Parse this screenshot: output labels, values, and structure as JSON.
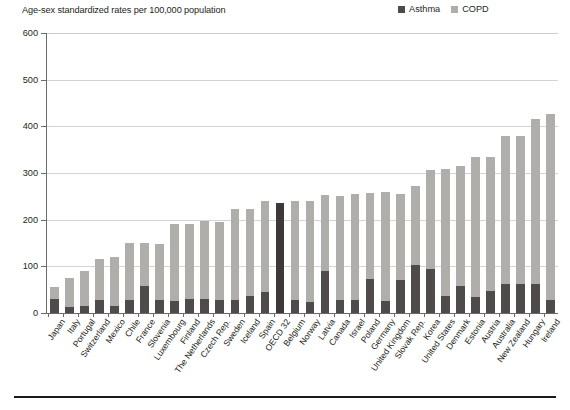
{
  "header": {
    "axis_note": "Age-sex standardized rates per 100,000 population"
  },
  "legend": {
    "position": "top-right",
    "entries": [
      {
        "label": "Asthma",
        "color": "#4f4b4a"
      },
      {
        "label": "COPD",
        "color": "#b0aeab"
      }
    ]
  },
  "colors": {
    "asthma": "#4f4b4a",
    "copd": "#b0aeab",
    "highlight": "#3c3938",
    "axis": "#6d6b6a",
    "gridline": "#d6d4d2",
    "text": "#231f20",
    "footer_rule": "#1a1a1a"
  },
  "chart_data": {
    "type": "bar",
    "subtype": "stacked-vertical",
    "title": "",
    "subtitle": "Age-sex standardized rates per 100,000 population",
    "xlabel": "",
    "ylabel": "Age-sex standardized rates per 100,000 population",
    "ylim": [
      0,
      600
    ],
    "yticks": [
      0,
      100,
      200,
      300,
      400,
      500,
      600
    ],
    "ytick_labels": [
      "0",
      "100",
      "200",
      "300",
      "400",
      "500",
      "600"
    ],
    "grid": true,
    "grid_axis": "y",
    "legend_entries": [
      "Asthma",
      "COPD"
    ],
    "highlight_category": "OECD 32",
    "categories": [
      "Japan",
      "Italy",
      "Portugal",
      "Switzerland",
      "Mexico",
      "Chile",
      "France",
      "Slovenia",
      "Luxembourg",
      "Finland",
      "The Netherlands",
      "Czech Rep.",
      "Sweden",
      "Iceland",
      "Spain",
      "OECD 32",
      "Belgium",
      "Norway",
      "Latvia",
      "Canada",
      "Israel",
      "Poland",
      "Germany",
      "United Kingdom",
      "Slovak Rep.",
      "Korea",
      "United States",
      "Denmark",
      "Estonia",
      "Austria",
      "Australia",
      "New Zealand",
      "Hungary",
      "Ireland"
    ],
    "series": [
      {
        "name": "Asthma",
        "color": "#4f4b4a",
        "values": [
          30,
          12,
          14,
          27,
          14,
          27,
          58,
          27,
          26,
          30,
          30,
          28,
          28,
          37,
          45,
          236,
          27,
          23,
          90,
          27,
          27,
          72,
          26,
          70,
          103,
          95,
          37,
          58,
          35,
          48,
          62,
          62,
          62,
          28
        ]
      },
      {
        "name": "COPD",
        "color": "#b0aeab",
        "values": [
          26,
          62,
          75,
          89,
          105,
          123,
          92,
          121,
          165,
          160,
          168,
          167,
          195,
          186,
          196,
          0,
          214,
          218,
          162,
          224,
          228,
          186,
          233,
          186,
          170,
          212,
          272,
          257,
          300,
          286,
          317,
          318,
          353,
          398
        ]
      }
    ],
    "totals": [
      56,
      74,
      89,
      116,
      119,
      150,
      150,
      148,
      191,
      190,
      198,
      195,
      223,
      223,
      241,
      236,
      241,
      241,
      252,
      251,
      255,
      258,
      259,
      256,
      273,
      307,
      309,
      315,
      335,
      334,
      379,
      380,
      415,
      426
    ]
  }
}
